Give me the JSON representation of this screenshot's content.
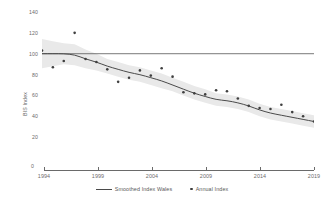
{
  "chart_data": {
    "type": "line",
    "title": "",
    "xlabel": "",
    "ylabel": "BIS Index",
    "xlim": [
      1994,
      2019
    ],
    "ylim": [
      0,
      140
    ],
    "yticks": [
      140,
      120,
      100,
      80,
      60,
      40,
      20,
      0
    ],
    "xticks": [
      1994,
      1999,
      2004,
      2009,
      2014,
      2019
    ],
    "grid": false,
    "legend_position": "bottom",
    "reference_line": {
      "value": 100,
      "label": ""
    },
    "x": [
      1994,
      1995,
      1996,
      1997,
      1998,
      1999,
      2000,
      2001,
      2002,
      2003,
      2004,
      2005,
      2006,
      2007,
      2008,
      2009,
      2010,
      2011,
      2012,
      2013,
      2014,
      2015,
      2016,
      2017,
      2018,
      2019
    ],
    "series": [
      {
        "name": "Annual Index",
        "style": "scatter",
        "values": [
          103,
          87,
          93,
          120,
          95,
          92,
          85,
          73,
          77,
          84,
          79,
          86,
          78,
          63,
          62,
          61,
          65,
          64,
          57,
          50,
          48,
          47,
          51,
          44,
          40,
          35
        ]
      },
      {
        "name": "Smoothed Index Wales",
        "style": "line",
        "values": [
          100,
          100,
          100,
          99,
          95,
          92,
          88,
          85,
          82,
          80,
          77,
          74,
          70,
          66,
          62,
          59,
          56,
          55,
          53,
          50,
          46,
          43,
          41,
          39,
          37,
          35
        ],
        "band_lower": [
          86,
          88,
          90,
          89,
          86,
          84,
          81,
          78,
          75,
          73,
          70,
          67,
          64,
          60,
          56,
          53,
          50,
          49,
          47,
          44,
          40,
          37,
          35,
          33,
          31,
          29
        ],
        "band_upper": [
          114,
          112,
          110,
          109,
          104,
          100,
          95,
          92,
          89,
          87,
          84,
          81,
          77,
          73,
          69,
          66,
          62,
          61,
          59,
          56,
          52,
          49,
          47,
          45,
          43,
          41
        ]
      }
    ],
    "legend": [
      {
        "label": "Smoothed Index Wales",
        "marker": "line",
        "color": "#4a4a4a"
      },
      {
        "label": "Annual Index",
        "marker": "dot",
        "color": "#3d3d3d"
      }
    ],
    "colors": {
      "line": "#4a4a4a",
      "point": "#3f3f3f",
      "band": "#e8e8e8",
      "axis": "#6a6a6a",
      "text": "#6b6b6b"
    }
  }
}
